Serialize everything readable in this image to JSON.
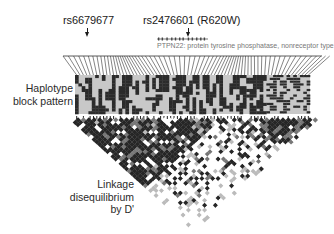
{
  "figure": {
    "snp_markers": [
      {
        "id": "rs6679677",
        "label": "rs6679677"
      },
      {
        "id": "rs2476601",
        "label": "rs2476601 (R620W)"
      }
    ],
    "gene": {
      "label": "PTPN22: protein tyrosine phosphatase, nonreceptor type"
    },
    "panels": {
      "haplotype": {
        "label_line1": "Haplotype",
        "label_line2": "block pattern"
      },
      "ld": {
        "label_line1": "Linkage",
        "label_line2": "disequilibrium",
        "label_line3": "by D'"
      }
    },
    "colors": {
      "dark": "#2b2b2b",
      "light": "#c8c8c8",
      "line": "#333333",
      "gene_text": "#777777"
    }
  }
}
